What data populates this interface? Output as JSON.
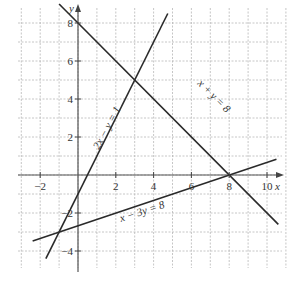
{
  "chart_data": {
    "type": "line",
    "title": "",
    "xlabel": "x",
    "ylabel": "y",
    "xlim": [
      -3,
      11
    ],
    "ylim": [
      -4,
      8
    ],
    "grid": true,
    "x_ticks": [
      "−2",
      "2",
      "4",
      "6",
      "8",
      "10"
    ],
    "y_ticks": [
      "8",
      "6",
      "4",
      "2",
      "−2",
      "−4"
    ],
    "series": [
      {
        "name": "x + y = 8",
        "x": [
          -1,
          10.6
        ],
        "y": [
          9,
          -2.6
        ]
      },
      {
        "name": "2x − y = 1",
        "x": [
          -1.7,
          4.75
        ],
        "y": [
          -4.4,
          8.5
        ]
      },
      {
        "name": "x − 3y = 8",
        "x": [
          -2.4,
          10.5
        ],
        "y": [
          -3.47,
          0.83
        ]
      }
    ],
    "intersections": [
      {
        "x": 3,
        "y": 5
      },
      {
        "x": 8,
        "y": 0
      },
      {
        "x": -1,
        "y": -3
      }
    ],
    "annotations": {
      "line1": "x + y = 8",
      "line2": "2x − y = 1",
      "line3": "x − 3y = 8"
    }
  }
}
